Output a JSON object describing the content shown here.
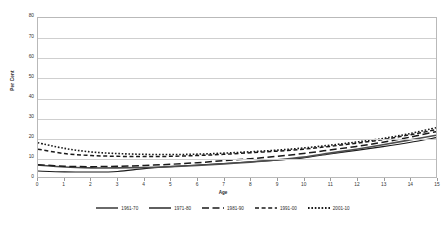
{
  "axes": {
    "y_title": "Per Cent",
    "x_title": "Age",
    "y_ticks": [
      "0",
      "10",
      "20",
      "30",
      "40",
      "50",
      "60",
      "70",
      "80"
    ],
    "x_ticks": [
      "0",
      "1",
      "2",
      "3",
      "4",
      "5",
      "6",
      "7",
      "8",
      "9",
      "10",
      "11",
      "12",
      "13",
      "14",
      "15"
    ]
  },
  "legend": {
    "items": [
      {
        "label": "1961-70",
        "style": "solid",
        "color": "#1a1a1a"
      },
      {
        "label": "1971-80",
        "style": "solid-thick",
        "color": "#4d4d4d"
      },
      {
        "label": "1981-90",
        "style": "long-dash",
        "color": "#1a1a1a"
      },
      {
        "label": "1991-00",
        "style": "dash",
        "color": "#1a1a1a"
      },
      {
        "label": "2001-10",
        "style": "dotted",
        "color": "#1a1a1a"
      }
    ]
  },
  "chart_data": {
    "type": "line",
    "title": "",
    "xlabel": "Age",
    "ylabel": "Per Cent",
    "xlim": [
      0,
      15
    ],
    "ylim": [
      0,
      80
    ],
    "ytick_step": 10,
    "grid": true,
    "legend_position": "bottom",
    "x": [
      0,
      1,
      2,
      3,
      4,
      5,
      6,
      7,
      8,
      9,
      10,
      11,
      12,
      13,
      14,
      15
    ],
    "series": [
      {
        "name": "1961-70",
        "style": "solid",
        "color": "#1a1a1a",
        "values": [
          3.0,
          2.6,
          2.5,
          2.8,
          4.2,
          5.2,
          6.0,
          6.8,
          7.6,
          8.5,
          9.6,
          11.6,
          13.4,
          15.3,
          17.4,
          19.8
        ]
      },
      {
        "name": "1971-80",
        "style": "solid-thick",
        "color": "#4d4d4d",
        "values": [
          6.0,
          5.0,
          4.6,
          4.6,
          4.8,
          5.2,
          5.8,
          6.6,
          7.5,
          8.6,
          10.0,
          12.0,
          14.0,
          16.2,
          18.6,
          21.0
        ]
      },
      {
        "name": "1981-90",
        "style": "long-dash",
        "color": "#1a1a1a",
        "values": [
          6.2,
          5.4,
          5.2,
          5.4,
          5.8,
          6.4,
          7.2,
          8.2,
          9.2,
          10.4,
          11.8,
          13.6,
          15.4,
          17.5,
          20.0,
          22.8
        ]
      },
      {
        "name": "1991-00",
        "style": "dash",
        "color": "#1a1a1a",
        "values": [
          14.0,
          11.8,
          10.8,
          10.4,
          10.3,
          10.4,
          10.8,
          11.4,
          12.2,
          13.0,
          14.0,
          15.4,
          17.0,
          18.8,
          21.2,
          23.8
        ]
      },
      {
        "name": "2001-10",
        "style": "dotted",
        "color": "#1a1a1a",
        "values": [
          17.2,
          14.4,
          12.6,
          11.8,
          11.4,
          11.3,
          11.5,
          12.0,
          12.7,
          13.5,
          14.6,
          16.0,
          17.6,
          19.4,
          21.8,
          24.8
        ]
      }
    ]
  }
}
